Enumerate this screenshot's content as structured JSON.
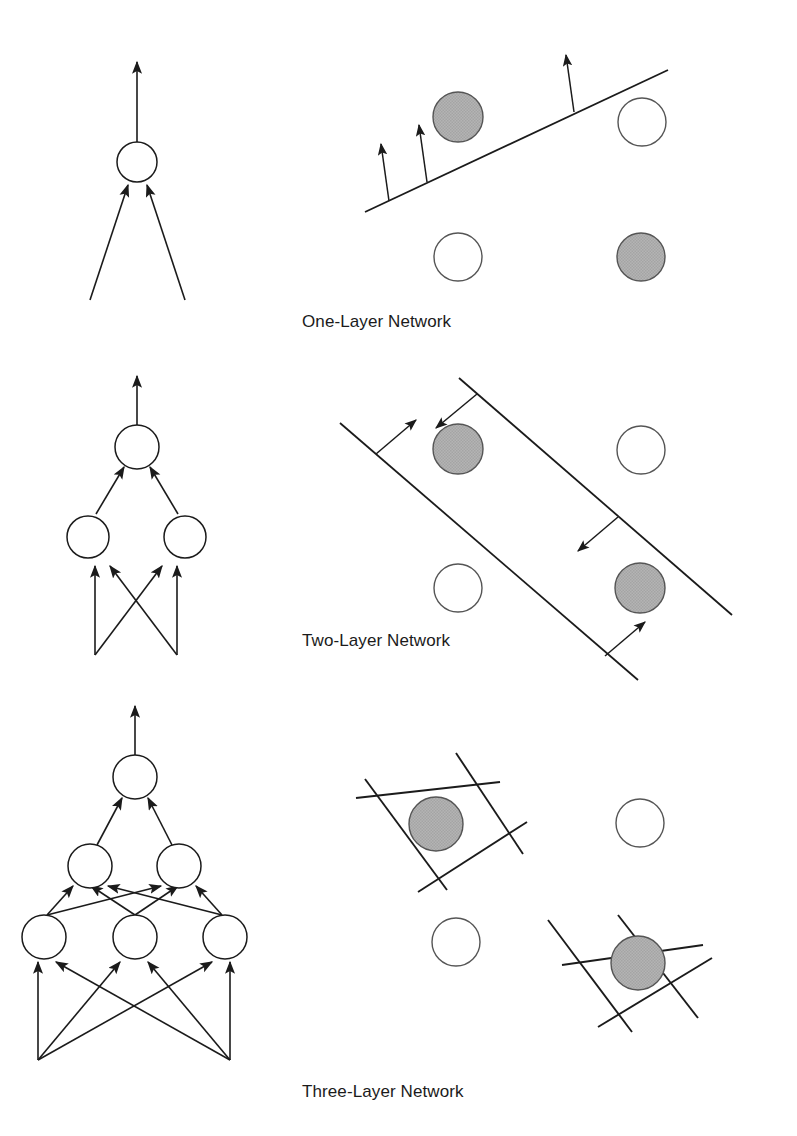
{
  "figure": {
    "background_color": "#ffffff",
    "stroke_color": "#1b1b1b",
    "node_fill": "#ffffff",
    "class_a_fill": "#ffffff",
    "class_b_fill": "#b0b0b0"
  },
  "rows": [
    {
      "id": "one-layer",
      "caption": "One-Layer Network",
      "network": {
        "layer_counts": [
          2,
          1
        ],
        "description": "Single output unit receiving two inputs"
      },
      "decision_region": {
        "type": "single-halfplane",
        "boundary_count": 1,
        "normal_arrow_count": 3,
        "points": [
          {
            "label": "class-b",
            "filled": true,
            "position": "top-left"
          },
          {
            "label": "class-a",
            "filled": false,
            "position": "top-right"
          },
          {
            "label": "class-a",
            "filled": false,
            "position": "bottom-left"
          },
          {
            "label": "class-b",
            "filled": true,
            "position": "bottom-right"
          }
        ]
      }
    },
    {
      "id": "two-layer",
      "caption": "Two-Layer Network",
      "network": {
        "layer_counts": [
          2,
          2,
          1
        ],
        "description": "Two inputs fully connected to two hidden units feeding one output unit"
      },
      "decision_region": {
        "type": "open-convex-strip",
        "boundary_count": 2,
        "normal_arrow_count": 3,
        "points": [
          {
            "label": "class-b",
            "filled": true,
            "position": "top-left"
          },
          {
            "label": "class-a",
            "filled": false,
            "position": "top-right"
          },
          {
            "label": "class-a",
            "filled": false,
            "position": "bottom-left"
          },
          {
            "label": "class-b",
            "filled": true,
            "position": "bottom-right"
          }
        ]
      }
    },
    {
      "id": "three-layer",
      "caption": "Three-Layer Network",
      "network": {
        "layer_counts": [
          2,
          3,
          2,
          1
        ],
        "description": "Two inputs fully connected to three hidden units, then two hidden units, then one output unit"
      },
      "decision_region": {
        "type": "arbitrary-closed-regions",
        "boundary_count": 8,
        "normal_arrow_count": 0,
        "points": [
          {
            "label": "class-b",
            "filled": true,
            "position": "top-left",
            "enclosed": true
          },
          {
            "label": "class-a",
            "filled": false,
            "position": "top-right",
            "enclosed": false
          },
          {
            "label": "class-a",
            "filled": false,
            "position": "bottom-left",
            "enclosed": false
          },
          {
            "label": "class-b",
            "filled": true,
            "position": "bottom-right",
            "enclosed": true
          }
        ]
      }
    }
  ]
}
